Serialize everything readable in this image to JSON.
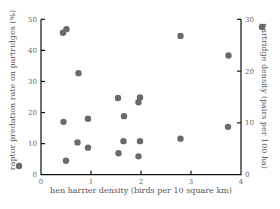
{
  "chart_data": {
    "type": "scatter",
    "title": "",
    "xlabel": "hen harrier density (birds per 10 square km)",
    "ylabel_left": "raptor predation rate on partridges (%)",
    "ylabel_right": "partridge density (pairs per 100 ha)",
    "xlim": [
      0,
      4
    ],
    "ylim_left": [
      0,
      50
    ],
    "ylim_right": [
      0,
      30
    ],
    "x_ticks": [
      "0",
      "1",
      "2",
      "3",
      "4"
    ],
    "y_ticks_left": [
      "0",
      "10",
      "20",
      "30",
      "40",
      "50"
    ],
    "y_ticks_right": [
      "0",
      "10",
      "20",
      "30"
    ],
    "grid": false,
    "legend": [
      {
        "label": "raptor predation rate on partridges (%)",
        "axis": "left",
        "marker": "filled-circle",
        "color": "#6a6a6a"
      },
      {
        "label": "partridge density (pairs per 100 ha)",
        "axis": "right",
        "marker": "filled-circle",
        "color": "#6a6a6a"
      }
    ],
    "series": [
      {
        "name": "raptor predation rate on partridges (%)",
        "axis": "left",
        "points": [
          {
            "x": 0.45,
            "y": 17.0
          },
          {
            "x": 0.5,
            "y": 4.5
          },
          {
            "x": 0.73,
            "y": 10.4
          },
          {
            "x": 0.94,
            "y": 8.7
          },
          {
            "x": 1.55,
            "y": 6.9
          },
          {
            "x": 1.65,
            "y": 10.8
          },
          {
            "x": 1.95,
            "y": 5.9
          },
          {
            "x": 1.98,
            "y": 10.8
          },
          {
            "x": 2.79,
            "y": 11.6
          },
          {
            "x": 3.74,
            "y": 15.4
          }
        ]
      },
      {
        "name": "partridge density (pairs per 100 ha)",
        "axis": "right",
        "points": [
          {
            "x": 0.44,
            "y": 27.4
          },
          {
            "x": 0.51,
            "y": 28.1
          },
          {
            "x": 0.75,
            "y": 19.6
          },
          {
            "x": 0.94,
            "y": 10.8
          },
          {
            "x": 1.54,
            "y": 14.8
          },
          {
            "x": 1.66,
            "y": 11.3
          },
          {
            "x": 1.95,
            "y": 14.0
          },
          {
            "x": 1.98,
            "y": 14.9
          },
          {
            "x": 2.79,
            "y": 26.8
          },
          {
            "x": 3.75,
            "y": 23.0
          }
        ]
      }
    ]
  },
  "labels": {
    "xlabel": "hen harrier density (birds per 10 square km)",
    "ylabel_left": "raptor predation rate on partridges (%)",
    "ylabel_right": "partridge density (pairs per 100 ha)"
  }
}
